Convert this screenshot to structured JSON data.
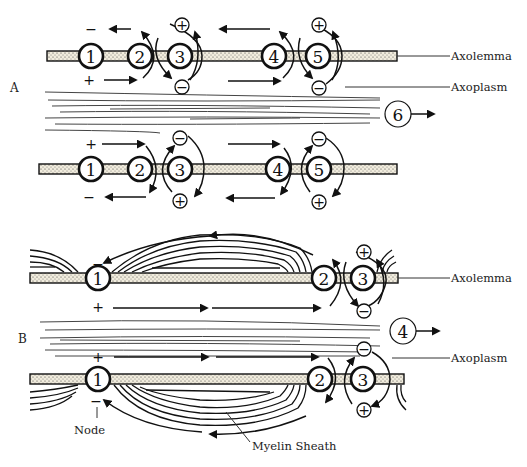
{
  "figure": {
    "sections": [
      {
        "id": "A",
        "label": "A",
        "description": "Continuous conduction in unmyelinated axon",
        "upper_row": {
          "nodes": [
            "1",
            "2",
            "3",
            "4",
            "5"
          ],
          "outside_sign_left": "−",
          "inside_sign_left": "+",
          "ion_top": "+",
          "ion_bottom": "−"
        },
        "lower_row": {
          "nodes": [
            "1",
            "2",
            "3",
            "4",
            "5"
          ],
          "outside_sign_left": "+",
          "inside_sign_left": "−",
          "ion_top": "−",
          "ion_bottom": "+"
        },
        "direction_marker": "6",
        "labels": {
          "axolemma": "Axolemma",
          "axoplasm": "Axoplasm"
        }
      },
      {
        "id": "B",
        "label": "B",
        "description": "Saltatory conduction in myelinated axon",
        "upper_row": {
          "nodes": [
            "1",
            "2",
            "3"
          ],
          "outside_sign_left": "−",
          "inside_sign_left": "+",
          "ion_top": "+",
          "ion_bottom": "−"
        },
        "lower_row": {
          "nodes": [
            "1",
            "2",
            "3"
          ],
          "outside_sign_left": "+",
          "inside_sign_left": "−",
          "ion_top": "−",
          "ion_bottom": "+"
        },
        "direction_marker": "4",
        "labels": {
          "axolemma": "Axolemma",
          "axoplasm": "Axoplasm",
          "node": "Node",
          "myelin_sheath": "Myelin Sheath"
        }
      }
    ],
    "signs": {
      "plus": "+",
      "minus": "−"
    }
  }
}
